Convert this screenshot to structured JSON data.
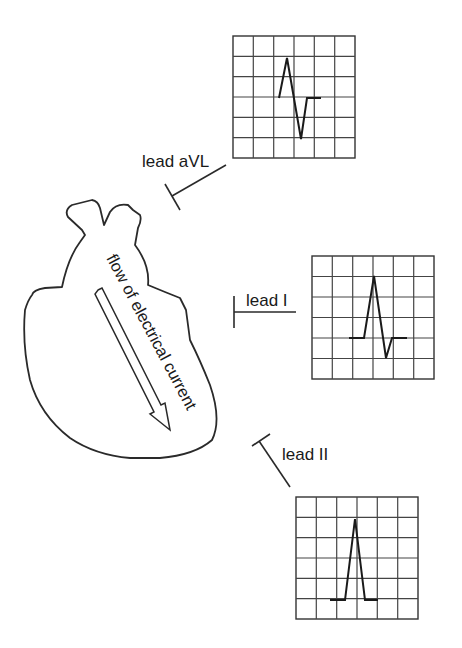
{
  "diagram": {
    "type": "ECG lead views of cardiac depolarization",
    "heart": {
      "label": "flow of electrical current",
      "arrow_direction": "down-right"
    },
    "leads": [
      {
        "id": "aVL",
        "label": "lead aVL",
        "waveform": "biphasic (equal up and down deflection)"
      },
      {
        "id": "I",
        "label": "lead I",
        "waveform": "mostly positive with small negative deflection"
      },
      {
        "id": "II",
        "label": "lead II",
        "waveform": "fully positive deflection"
      }
    ],
    "grid": {
      "columns": 6,
      "rows": 6
    }
  }
}
